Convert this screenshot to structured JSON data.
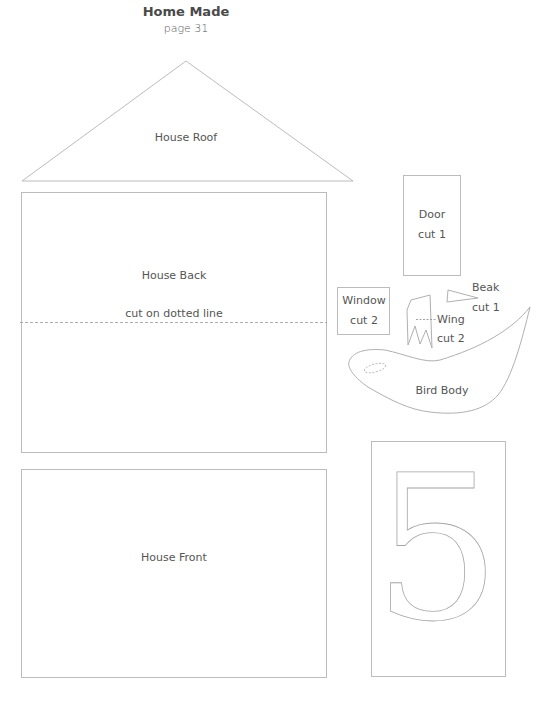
{
  "header": {
    "title": "Home Made",
    "page": "page 31"
  },
  "pieces": {
    "roof": {
      "label": "House Roof"
    },
    "back": {
      "label": "House Back",
      "note": "cut on dotted line"
    },
    "front": {
      "label": "House Front"
    },
    "door": {
      "label": "Door",
      "count": "cut 1"
    },
    "window": {
      "label": "Window",
      "count": "cut 2"
    },
    "wing": {
      "label": "Wing",
      "count": "cut 2"
    },
    "beak": {
      "label": "Beak",
      "count": "cut 1"
    },
    "bird_body": {
      "label": "Bird Body"
    },
    "number": {
      "glyph": "5"
    }
  },
  "colors": {
    "outline": "#b8b8b8",
    "text": "#555555"
  }
}
